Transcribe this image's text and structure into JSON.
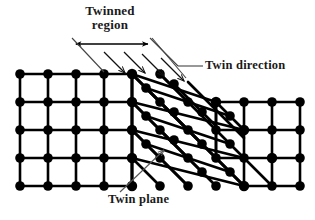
{
  "figure": {
    "background_color": "#ffffff",
    "atom_color": "#000000",
    "bond_color": "#000000",
    "annotation_color": "#1a1a1a",
    "leader_color": "#555555"
  },
  "labels": {
    "twinned_region_line1": "Twinned",
    "twinned_region_line2": "region",
    "twin_direction": "Twin direction",
    "twin_plane": "Twin plane"
  },
  "annotations": {
    "span_arrow_name": "twinned-region-span-arrow",
    "twin_direction_arrow_count": 4,
    "twin_direction_arrow_label": "shear-direction-arrow"
  },
  "diagram_data": {
    "type": "lattice-diagram",
    "regions": [
      {
        "name": "parent-lattice-left",
        "lattice": "square",
        "rows": 5,
        "cols": 5,
        "spacing_px": 28,
        "origin": [
          20,
          74
        ],
        "shear": 0.0
      },
      {
        "name": "twinned-region-middle",
        "lattice": "sheared",
        "rows": 5,
        "cols": 4,
        "spacing_px": 28,
        "origin": [
          132,
          74
        ],
        "shear": 0.62
      },
      {
        "name": "parent-lattice-right",
        "lattice": "square",
        "rows": 5,
        "cols": 5,
        "spacing_px": 28,
        "origin": [
          216,
          102
        ],
        "shear": 0.0
      }
    ],
    "twin_planes": [
      {
        "name": "twin-plane-upper",
        "from": [
          132,
          74
        ],
        "to": [
          244,
          186
        ]
      },
      {
        "name": "twin-plane-lower",
        "from": [
          20,
          186
        ],
        "to": [
          132,
          74
        ]
      }
    ]
  }
}
